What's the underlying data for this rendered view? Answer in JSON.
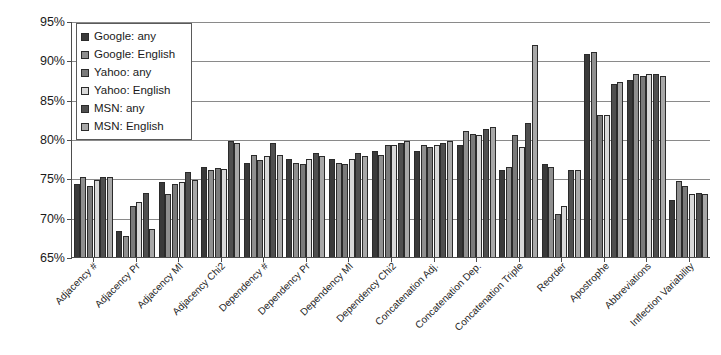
{
  "chart_data": {
    "type": "bar",
    "title": "",
    "subtitle": "",
    "xlabel": "",
    "ylabel": "",
    "ylim": [
      65,
      95
    ],
    "ytick_labels": [
      "95%",
      "90%",
      "85%",
      "80%",
      "75%",
      "70%",
      "65%"
    ],
    "ytick_values": [
      95,
      90,
      85,
      80,
      75,
      70,
      65
    ],
    "grid": true,
    "legend_position": "top-left inside plot",
    "categories": [
      "Adjacency #",
      "Adjacency Pr",
      "Adjacency MI",
      "Adjacency Chi2",
      "Dependency #",
      "Dependency Pr",
      "Dependency MI",
      "Dependency Chi2",
      "Concatenation Adj.",
      "Concatenation Dep.",
      "Concatenation Triple",
      "Reorder",
      "Apostrophe",
      "Abbreviations",
      "Inflection Variability"
    ],
    "series": [
      {
        "name": "Google: any",
        "color": "#3a3a3a",
        "values": [
          74.3,
          68.3,
          74.5,
          76.5,
          77.0,
          77.5,
          77.5,
          78.5,
          78.5,
          79.2,
          76.0,
          76.8,
          90.8,
          87.5,
          72.2
        ]
      },
      {
        "name": "Google: English",
        "color": "#8f8f8f",
        "values": [
          75.2,
          67.7,
          73.0,
          76.0,
          78.0,
          77.0,
          77.0,
          78.0,
          79.2,
          81.0,
          76.5,
          76.5,
          91.0,
          88.3,
          74.7
        ]
      },
      {
        "name": "Yahoo: any",
        "color": "#7a7a7a",
        "values": [
          74.0,
          71.5,
          74.3,
          76.3,
          77.3,
          76.8,
          76.8,
          79.3,
          79.0,
          80.7,
          80.5,
          70.5,
          83.0,
          88.0,
          74.0
        ]
      },
      {
        "name": "Yahoo: English",
        "color": "#d8d8d8",
        "values": [
          74.8,
          72.0,
          74.5,
          76.2,
          77.8,
          77.5,
          77.5,
          79.3,
          79.2,
          80.5,
          79.0,
          71.5,
          83.0,
          88.3,
          73.0
        ]
      },
      {
        "name": "MSN: any",
        "color": "#4f4f4f",
        "values": [
          75.2,
          73.2,
          75.8,
          79.7,
          79.5,
          78.2,
          78.2,
          79.5,
          79.5,
          81.3,
          82.0,
          76.0,
          87.0,
          88.3,
          73.2
        ]
      },
      {
        "name": "MSN: English",
        "color": "#a8a8a8",
        "values": [
          75.2,
          68.5,
          74.8,
          79.5,
          78.0,
          77.8,
          77.8,
          79.7,
          79.7,
          81.5,
          92.0,
          76.0,
          87.3,
          88.0,
          73.0
        ]
      }
    ]
  },
  "legend": {
    "items": [
      {
        "label": "Google: any"
      },
      {
        "label": "Google: English"
      },
      {
        "label": "Yahoo: any"
      },
      {
        "label": "Yahoo: English"
      },
      {
        "label": "MSN: any"
      },
      {
        "label": "MSN: English"
      }
    ]
  },
  "colors": {
    "axis": "#4d4d4d",
    "grid": "#8a8a8a",
    "text": "#1a1a1a",
    "background": "#ffffff"
  }
}
